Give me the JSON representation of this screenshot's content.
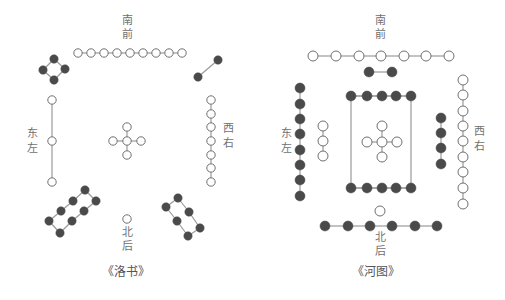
{
  "colors": {
    "line": "#9a9a9a",
    "white_dot_stroke": "#707070",
    "black_dot": "#4a4a4a",
    "text": "#707070"
  },
  "luoshu": {
    "caption": "《洛书》",
    "labels": {
      "south": [
        "南",
        "前"
      ],
      "north": [
        "北",
        "后"
      ],
      "east": [
        "东",
        "左"
      ],
      "west": [
        "西",
        "右"
      ]
    },
    "groups": [
      {
        "name": "top-9-white",
        "type": "white",
        "count": 9,
        "points": [
          [
            78,
            53
          ],
          [
            91,
            53
          ],
          [
            104,
            53
          ],
          [
            117,
            53
          ],
          [
            130,
            53
          ],
          [
            143,
            53
          ],
          [
            156,
            53
          ],
          [
            169,
            53
          ],
          [
            182,
            53
          ]
        ],
        "edges": "chain"
      },
      {
        "name": "top-left-4-black",
        "type": "black",
        "count": 4,
        "points": [
          [
            54,
            59
          ],
          [
            43,
            70
          ],
          [
            65,
            69
          ],
          [
            54,
            80
          ]
        ],
        "edges": [
          [
            0,
            1
          ],
          [
            0,
            2
          ],
          [
            1,
            3
          ],
          [
            2,
            3
          ]
        ]
      },
      {
        "name": "top-right-2-black",
        "type": "black",
        "count": 2,
        "points": [
          [
            218,
            60
          ],
          [
            198,
            77
          ]
        ],
        "edges": "chain"
      },
      {
        "name": "left-3-white",
        "type": "white",
        "count": 3,
        "points": [
          [
            52,
            100
          ],
          [
            52,
            141
          ],
          [
            52,
            182
          ]
        ],
        "edges": "chain"
      },
      {
        "name": "center-5-white",
        "type": "white",
        "count": 5,
        "points": [
          [
            127,
            127
          ],
          [
            113,
            141
          ],
          [
            127,
            141
          ],
          [
            141,
            141
          ],
          [
            127,
            155
          ]
        ],
        "edges": [
          [
            0,
            2
          ],
          [
            1,
            2
          ],
          [
            2,
            3
          ],
          [
            2,
            4
          ]
        ]
      },
      {
        "name": "right-7-white",
        "type": "white",
        "count": 7,
        "points": [
          [
            211,
            100
          ],
          [
            211,
            114
          ],
          [
            211,
            127
          ],
          [
            211,
            141
          ],
          [
            211,
            155
          ],
          [
            211,
            168
          ],
          [
            211,
            182
          ]
        ],
        "edges": "chain"
      },
      {
        "name": "bottom-left-8-black",
        "type": "black",
        "count": 8,
        "points": [
          [
            85,
            190
          ],
          [
            96,
            201
          ],
          [
            73,
            201
          ],
          [
            84,
            211
          ],
          [
            61,
            211
          ],
          [
            72,
            221
          ],
          [
            49,
            221
          ],
          [
            60,
            233
          ]
        ],
        "edges": [
          [
            0,
            2
          ],
          [
            2,
            4
          ],
          [
            4,
            6
          ],
          [
            6,
            7
          ],
          [
            7,
            5
          ],
          [
            5,
            3
          ],
          [
            3,
            1
          ],
          [
            1,
            0
          ]
        ]
      },
      {
        "name": "bottom-right-6-black",
        "type": "black",
        "count": 6,
        "points": [
          [
            178,
            198
          ],
          [
            166,
            207
          ],
          [
            189,
            212
          ],
          [
            177,
            221
          ],
          [
            200,
            228
          ],
          [
            188,
            236
          ]
        ],
        "edges": [
          [
            0,
            1
          ],
          [
            1,
            3
          ],
          [
            3,
            5
          ],
          [
            5,
            4
          ],
          [
            4,
            2
          ],
          [
            2,
            0
          ]
        ]
      },
      {
        "name": "bottom-1-white",
        "type": "white",
        "count": 1,
        "points": [
          [
            127,
            219
          ]
        ],
        "edges": "chain"
      }
    ]
  },
  "hetu": {
    "caption": "《河图》",
    "labels": {
      "south": [
        "南",
        "前"
      ],
      "north": [
        "北",
        "后"
      ],
      "east": [
        "东",
        "左"
      ],
      "west": [
        "西",
        "右"
      ]
    },
    "groups": [
      {
        "name": "top-7-white",
        "type": "white",
        "count": 7,
        "points": [
          [
            313,
            56
          ],
          [
            336,
            56
          ],
          [
            359,
            56
          ],
          [
            381,
            56
          ],
          [
            404,
            56
          ],
          [
            426,
            56
          ],
          [
            449,
            56
          ]
        ],
        "edges": "chain"
      },
      {
        "name": "top-2-black",
        "type": "black",
        "count": 2,
        "points": [
          [
            369,
            72
          ],
          [
            392,
            72
          ]
        ],
        "edges": "chain"
      },
      {
        "name": "inner-top-5-black",
        "type": "black",
        "count": 5,
        "points": [
          [
            351,
            96
          ],
          [
            367,
            96
          ],
          [
            382,
            96
          ],
          [
            396,
            96
          ],
          [
            411,
            96
          ]
        ],
        "edges": "chain"
      },
      {
        "name": "inner-bottom-5-black",
        "type": "black",
        "count": 5,
        "points": [
          [
            351,
            188
          ],
          [
            367,
            188
          ],
          [
            382,
            188
          ],
          [
            396,
            188
          ],
          [
            411,
            188
          ]
        ],
        "edges": "chain"
      },
      {
        "name": "left-8-black",
        "type": "black",
        "count": 8,
        "points": [
          [
            300,
            88
          ],
          [
            300,
            104
          ],
          [
            300,
            119
          ],
          [
            300,
            134
          ],
          [
            300,
            150
          ],
          [
            300,
            165
          ],
          [
            300,
            180
          ],
          [
            300,
            196
          ]
        ],
        "edges": "chain"
      },
      {
        "name": "left-3-white",
        "type": "white",
        "count": 3,
        "points": [
          [
            323,
            126
          ],
          [
            323,
            141
          ],
          [
            323,
            156
          ]
        ],
        "edges": "chain"
      },
      {
        "name": "center-5-white",
        "type": "white",
        "count": 5,
        "points": [
          [
            382,
            126
          ],
          [
            367,
            142
          ],
          [
            382,
            142
          ],
          [
            397,
            142
          ],
          [
            382,
            157
          ]
        ],
        "edges": [
          [
            0,
            2
          ],
          [
            1,
            2
          ],
          [
            2,
            3
          ],
          [
            2,
            4
          ]
        ]
      },
      {
        "name": "right-4-black",
        "type": "black",
        "count": 4,
        "points": [
          [
            441,
            118
          ],
          [
            441,
            133
          ],
          [
            441,
            148
          ],
          [
            441,
            164
          ]
        ],
        "edges": "chain"
      },
      {
        "name": "right-9-white",
        "type": "white",
        "count": 9,
        "points": [
          [
            463,
            80
          ],
          [
            463,
            95
          ],
          [
            463,
            111
          ],
          [
            463,
            126
          ],
          [
            463,
            141
          ],
          [
            463,
            157
          ],
          [
            463,
            172
          ],
          [
            463,
            188
          ],
          [
            463,
            204
          ]
        ],
        "edges": "chain"
      },
      {
        "name": "bottom-1-white",
        "type": "white",
        "count": 1,
        "points": [
          [
            380,
            211
          ]
        ],
        "edges": "chain"
      },
      {
        "name": "bottom-6-black",
        "type": "black",
        "count": 6,
        "points": [
          [
            325,
            226
          ],
          [
            348,
            226
          ],
          [
            370,
            226
          ],
          [
            392,
            226
          ],
          [
            415,
            226
          ],
          [
            437,
            226
          ]
        ],
        "edges": "chain"
      }
    ],
    "frame": {
      "x1": 351,
      "y1": 96,
      "x2": 411,
      "y2": 188
    }
  }
}
